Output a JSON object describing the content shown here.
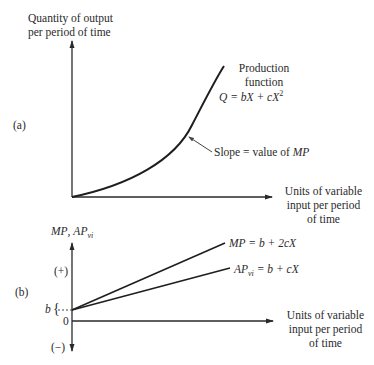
{
  "panel_a": {
    "label": "(a)",
    "y_axis_label_line1": "Quantity of output",
    "y_axis_label_line2": "per period of time",
    "x_axis_label_line1": "Units of variable",
    "x_axis_label_line2": "input per period",
    "x_axis_label_line3": "of time",
    "curve_label_line1": "Production",
    "curve_label_line2": "function",
    "curve_eq_Q": "Q",
    "curve_eq_mid": " = bX + cX",
    "curve_eq_exp": "2",
    "slope_note_text": "Slope = value of ",
    "slope_note_mp": "MP"
  },
  "panel_b": {
    "label": "(b)",
    "y_axis_label_mp": "MP",
    "y_axis_label_sep": ", ",
    "y_axis_label_ap": "AP",
    "y_axis_label_sub": "vi",
    "plus_label": "(+)",
    "minus_label": "(−)",
    "zero_label": "0",
    "b_label": "b",
    "brace": "{",
    "x_axis_label_line1": "Units of variable",
    "x_axis_label_line2": "input per period",
    "x_axis_label_line3": "of time",
    "mp_line_label_mp": "MP",
    "mp_line_label_eq": " = b + 2cX",
    "ap_line_label_ap": "AP",
    "ap_line_label_sub": "vi",
    "ap_line_label_eq": " = b + cX"
  },
  "colors": {
    "line": "#2a2a2a",
    "text": "#2a2a2a",
    "background": "#ffffff"
  }
}
